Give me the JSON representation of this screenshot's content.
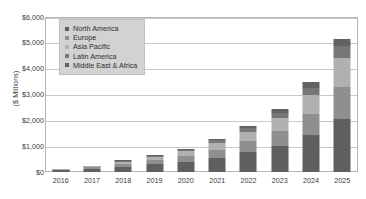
{
  "chart_data": {
    "type": "bar",
    "stacked": true,
    "title": "",
    "xlabel": "",
    "ylabel": "($ Millions)",
    "ylim": [
      0,
      6000
    ],
    "ytick_values": [
      0,
      1000,
      2000,
      3000,
      4000,
      5000,
      6000
    ],
    "ytick_labels": [
      "$0",
      "$1,000",
      "$2,000",
      "$3,000",
      "$4,000",
      "$5,000",
      "$6,000"
    ],
    "grid": true,
    "legend_position": "top-left-inside",
    "categories": [
      "2016",
      "2017",
      "2018",
      "2019",
      "2020",
      "2021",
      "2022",
      "2023",
      "2024",
      "2025"
    ],
    "series": [
      {
        "name": "North America",
        "color": "#5f5f5f",
        "values": [
          60,
          120,
          210,
          300,
          400,
          560,
          760,
          1010,
          1420,
          2060
        ]
      },
      {
        "name": "Europe",
        "color": "#8f8f8f",
        "values": [
          30,
          60,
          110,
          160,
          220,
          310,
          430,
          580,
          830,
          1240
        ]
      },
      {
        "name": "Asia Pacific",
        "color": "#b0b0b0",
        "values": [
          20,
          45,
          85,
          130,
          180,
          260,
          370,
          510,
          740,
          1130
        ]
      },
      {
        "name": "Latin America",
        "color": "#777777",
        "values": [
          7,
          15,
          30,
          45,
          65,
          95,
          135,
          190,
          280,
          430
        ]
      },
      {
        "name": "Middle East & Africa",
        "color": "#616161",
        "values": [
          5,
          10,
          20,
          30,
          45,
          65,
          95,
          135,
          200,
          300
        ]
      }
    ],
    "totals": [
      122,
      250,
      455,
      665,
      910,
      1290,
      1790,
      2425,
      3470,
      5160
    ]
  },
  "legend": {
    "items": [
      {
        "label": "North America"
      },
      {
        "label": "Europe"
      },
      {
        "label": "Asia Pacific"
      },
      {
        "label": "Latin America"
      },
      {
        "label": "Middle East & Africa"
      }
    ]
  },
  "colors": {
    "plot_border": "#b4b4b4",
    "gridline": "#c8c8c8",
    "legend_background": "#d2d2d2",
    "text": "#3b3b3b",
    "page_background": "#ffffff"
  }
}
